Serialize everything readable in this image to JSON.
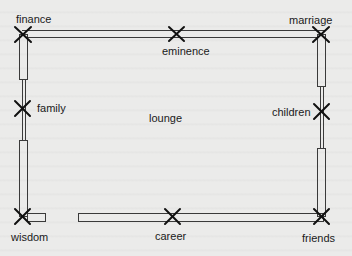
{
  "diagram": {
    "title": "",
    "room_label": "lounge",
    "areas": [
      {
        "id": "finance",
        "label": "finance",
        "x": 22,
        "y": 34
      },
      {
        "id": "eminence",
        "label": "eminence",
        "x": 176,
        "y": 34
      },
      {
        "id": "marriage",
        "label": "marriage",
        "x": 321,
        "y": 34
      },
      {
        "id": "family",
        "label": "family",
        "x": 22,
        "y": 108
      },
      {
        "id": "children",
        "label": "children",
        "x": 321,
        "y": 112
      },
      {
        "id": "wisdom",
        "label": "wisdom",
        "x": 22,
        "y": 217
      },
      {
        "id": "career",
        "label": "career",
        "x": 172,
        "y": 217
      },
      {
        "id": "friends",
        "label": "friends",
        "x": 321,
        "y": 217
      }
    ],
    "colors": {
      "background": "#ebebea",
      "wall_line": "#3a3a3a",
      "marker": "#111111",
      "text": "#1a1a1a"
    }
  }
}
